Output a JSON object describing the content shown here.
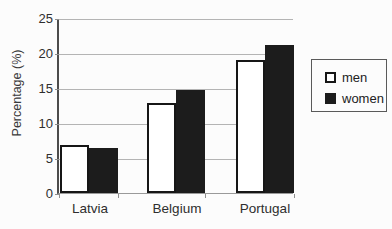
{
  "chart_data": {
    "type": "bar",
    "title": "",
    "xlabel": "",
    "ylabel": "Percentage (%)",
    "categories": [
      "Latvia",
      "Belgium",
      "Portugal"
    ],
    "series": [
      {
        "name": "men",
        "values": [
          6.8,
          12.8,
          19.0
        ],
        "fill": "#ffffff",
        "stroke": "#161616"
      },
      {
        "name": "women",
        "values": [
          6.5,
          14.7,
          21.2
        ],
        "fill": "#1c1c1c",
        "stroke": "#1c1c1c"
      }
    ],
    "ylim": [
      0,
      25
    ],
    "yticks": [
      0,
      5,
      10,
      15,
      20,
      25
    ],
    "grid": true,
    "legend_position": "right",
    "colors": {
      "gridline": "#b4b4b4",
      "y_axis": "#4c4c4c",
      "x_axis": "#9a9a9a",
      "text": "#2e2e2e"
    }
  }
}
